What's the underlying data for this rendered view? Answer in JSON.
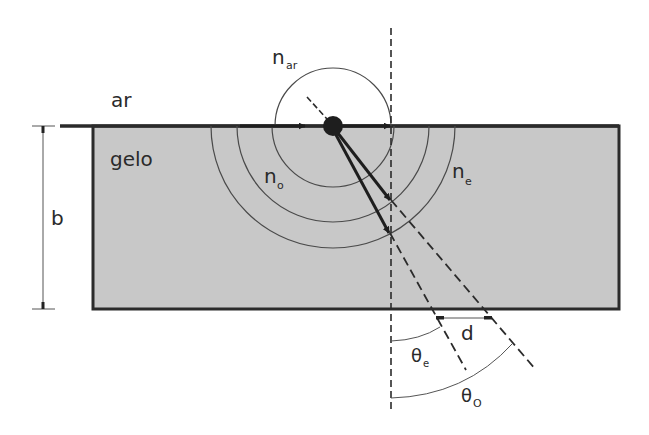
{
  "diagram": {
    "labels": {
      "air": "ar",
      "ice": "gelo",
      "thickness": "b",
      "n_air_main": "n",
      "n_air_sub": "ar",
      "n_o_main": "n",
      "n_o_sub": "o",
      "n_e_main": "n",
      "n_e_sub": "e",
      "displacement": "d",
      "theta_e_main": "θ",
      "theta_e_sub": "e",
      "theta_o_main": "θ",
      "theta_o_sub": "O"
    },
    "colors": {
      "ice_fill": "#c8c8c8",
      "stroke": "#2b2b2b",
      "thin": "#555555",
      "background": "#ffffff"
    }
  }
}
